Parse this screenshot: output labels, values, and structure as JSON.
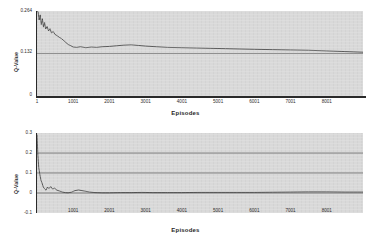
{
  "chart_data": [
    {
      "type": "line",
      "title": "(a) Optimal Value Convergence",
      "xlabel": "Episodes",
      "ylabel": "Q-Value",
      "xlim": [
        1,
        9000
      ],
      "ylim": [
        0,
        0.264
      ],
      "xticks": [
        "1",
        "1001",
        "2001",
        "3001",
        "4001",
        "5001",
        "6001",
        "7001",
        "8001"
      ],
      "xtick_values": [
        1,
        1001,
        2001,
        3001,
        4001,
        5001,
        6001,
        7001,
        8001
      ],
      "yticks": [
        "0.264",
        "0.132",
        "0"
      ],
      "ytick_values": [
        0.264,
        0.132,
        0
      ],
      "grid": true,
      "legend": "none",
      "series": [
        {
          "name": "Q-Value",
          "x": [
            1,
            30,
            60,
            90,
            120,
            150,
            180,
            210,
            240,
            280,
            320,
            360,
            400,
            450,
            500,
            560,
            620,
            680,
            740,
            800,
            860,
            920,
            1000,
            1100,
            1200,
            1350,
            1500,
            1650,
            1800,
            2000,
            2200,
            2400,
            2600,
            2800,
            3000,
            3300,
            3600,
            4000,
            4400,
            4800,
            5200,
            5600,
            6000,
            6500,
            7000,
            7500,
            8000,
            8500,
            9000
          ],
          "y": [
            0.264,
            0.262,
            0.236,
            0.252,
            0.222,
            0.24,
            0.214,
            0.228,
            0.208,
            0.216,
            0.202,
            0.209,
            0.196,
            0.2,
            0.191,
            0.187,
            0.182,
            0.178,
            0.172,
            0.166,
            0.16,
            0.157,
            0.152,
            0.151,
            0.153,
            0.15,
            0.152,
            0.151,
            0.153,
            0.154,
            0.156,
            0.158,
            0.159,
            0.157,
            0.155,
            0.153,
            0.151,
            0.15,
            0.149,
            0.148,
            0.147,
            0.146,
            0.145,
            0.144,
            0.143,
            0.142,
            0.14,
            0.138,
            0.136
          ]
        }
      ]
    },
    {
      "type": "line",
      "title": "(b) Optimal Value for Trace Equivalent Processes",
      "xlabel": "Episodes",
      "ylabel": "Q-Value",
      "xlim": [
        1,
        9000
      ],
      "ylim": [
        -0.1,
        0.3
      ],
      "xticks": [
        "1001",
        "2001",
        "3001",
        "4001",
        "5001",
        "6001",
        "7001",
        "8001"
      ],
      "xtick_values": [
        1001,
        2001,
        3001,
        4001,
        5001,
        6001,
        7001,
        8001
      ],
      "yticks": [
        "0.3",
        "0.2",
        "0.1",
        "0",
        "-0.1"
      ],
      "ytick_values": [
        0.3,
        0.2,
        0.1,
        0,
        -0.1
      ],
      "grid": true,
      "legend": "none",
      "series": [
        {
          "name": "Q-Value",
          "x": [
            1,
            25,
            50,
            80,
            110,
            140,
            175,
            210,
            250,
            290,
            330,
            380,
            430,
            490,
            550,
            620,
            700,
            780,
            860,
            950,
            1050,
            1150,
            1300,
            1450,
            1600,
            1800,
            2000,
            2300,
            2600,
            2900,
            3200,
            3600,
            4000,
            4500,
            5000,
            5500,
            6000,
            6500,
            7000,
            7500,
            8000,
            8500,
            9000
          ],
          "y": [
            0.292,
            0.19,
            0.126,
            0.092,
            0.064,
            0.05,
            0.03,
            0.021,
            0.014,
            0.03,
            0.022,
            0.032,
            0.02,
            0.024,
            0.014,
            0.01,
            0.005,
            0.002,
            0.001,
            0.004,
            0.012,
            0.015,
            0.01,
            0.005,
            0.002,
            0.001,
            0.001,
            0.002,
            0.002,
            0.003,
            0.002,
            0.002,
            0.002,
            0.003,
            0.003,
            0.003,
            0.003,
            0.004,
            0.005,
            0.006,
            0.006,
            0.005,
            0.005
          ]
        }
      ]
    }
  ]
}
